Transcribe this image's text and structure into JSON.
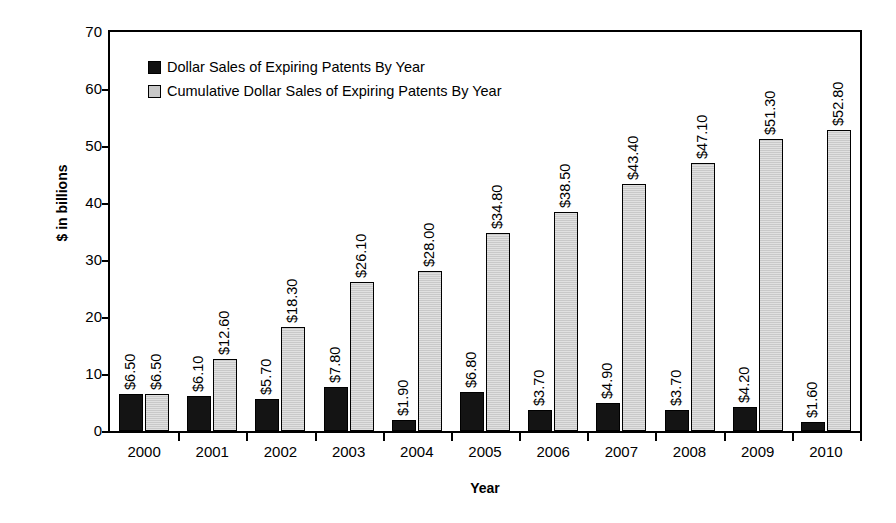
{
  "chart_data": {
    "type": "bar",
    "title": "",
    "xlabel": "Year",
    "ylabel": "$ in billions",
    "categories": [
      "2000",
      "2001",
      "2002",
      "2003",
      "2004",
      "2005",
      "2006",
      "2007",
      "2008",
      "2009",
      "2010"
    ],
    "ylim": [
      0,
      70
    ],
    "yticks": [
      0,
      10,
      20,
      30,
      40,
      50,
      60,
      70
    ],
    "ytick_labels": [
      "0",
      "10",
      "20",
      "30",
      "40",
      "50",
      "60",
      "70"
    ],
    "grid": false,
    "legend_position": "top-left inside plot area",
    "series": [
      {
        "name": "Dollar Sales of Expiring Patents By Year",
        "color": "#141414",
        "values": [
          6.5,
          6.1,
          5.7,
          7.8,
          1.9,
          6.8,
          3.7,
          4.9,
          3.7,
          4.2,
          1.6
        ],
        "labels": [
          "$6.50",
          "$6.10",
          "$5.70",
          "$7.80",
          "$1.90",
          "$6.80",
          "$3.70",
          "$4.90",
          "$3.70",
          "$4.20",
          "$1.60"
        ]
      },
      {
        "name": "Cumulative Dollar Sales of Expiring Patents By Year",
        "color": "#c9c9c9",
        "values": [
          6.5,
          12.6,
          18.3,
          26.1,
          28.0,
          34.8,
          38.5,
          43.4,
          47.1,
          51.3,
          52.8
        ],
        "labels": [
          "$6.50",
          "$12.60",
          "$18.30",
          "$26.10",
          "$28.00",
          "$34.80",
          "$38.50",
          "$43.40",
          "$47.10",
          "$51.30",
          "$52.80"
        ]
      }
    ]
  },
  "colors": {
    "series_dark": "#141414",
    "series_light": "#c9c9c9",
    "axis": "#000000",
    "background": "#ffffff"
  }
}
